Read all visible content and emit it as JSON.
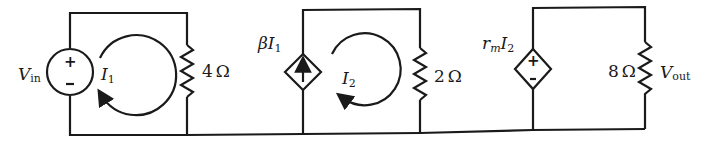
{
  "diagram": {
    "type": "circuit-schematic",
    "stroke_color": "#1a1a1a",
    "background": "#ffffff",
    "sources": [
      {
        "id": "vin",
        "kind": "independent-voltage-source",
        "label_main": "V",
        "label_sub": "in",
        "polarity_top": "+",
        "polarity_bottom": "-"
      },
      {
        "id": "cccs",
        "kind": "dependent-current-source",
        "label_greek": "β",
        "label_var": "I",
        "label_sub": "1",
        "arrow": "up"
      },
      {
        "id": "ccvs",
        "kind": "dependent-voltage-source",
        "label_coef": "r",
        "label_coef_sub": "m",
        "label_var": "I",
        "label_sub": "2",
        "polarity_top": "+",
        "polarity_bottom": "-"
      }
    ],
    "resistors": [
      {
        "id": "r1",
        "value": "4",
        "unit": "Ω"
      },
      {
        "id": "r2",
        "value": "2",
        "unit": "Ω"
      },
      {
        "id": "r3",
        "value": "8",
        "unit": "Ω"
      }
    ],
    "mesh_currents": [
      {
        "id": "i1",
        "label_var": "I",
        "label_sub": "1",
        "direction": "clockwise"
      },
      {
        "id": "i2",
        "label_var": "I",
        "label_sub": "2",
        "direction": "clockwise"
      }
    ],
    "output": {
      "label_main": "V",
      "label_sub": "out"
    }
  }
}
